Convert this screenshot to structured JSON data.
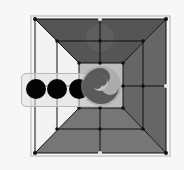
{
  "game": {
    "name": "Nine Men's Morris",
    "colors": {
      "background": "#f7f7f7",
      "frame": "#c8c8c8",
      "top_face": "#555555",
      "left_face": "#f2f2f2",
      "right_face": "#666666",
      "bottom_face": "#767676",
      "inner_square": "#bdbdbd",
      "line": "#111111",
      "black_piece": "#050505",
      "swirl_piece": "#5a5a5a"
    },
    "board": {
      "outer": [
        35,
        19,
        166,
        153
      ],
      "middle": [
        57,
        41,
        143,
        129
      ],
      "inner": [
        79,
        63,
        123,
        108
      ]
    },
    "tray": {
      "pieces": [
        {
          "color": "black",
          "x": 36,
          "y": 89
        },
        {
          "color": "black",
          "x": 57,
          "y": 89
        },
        {
          "color": "black",
          "x": 79,
          "y": 89
        }
      ]
    },
    "selected_piece": {
      "icon": "swirl-icon",
      "x": 101,
      "y": 86
    }
  }
}
